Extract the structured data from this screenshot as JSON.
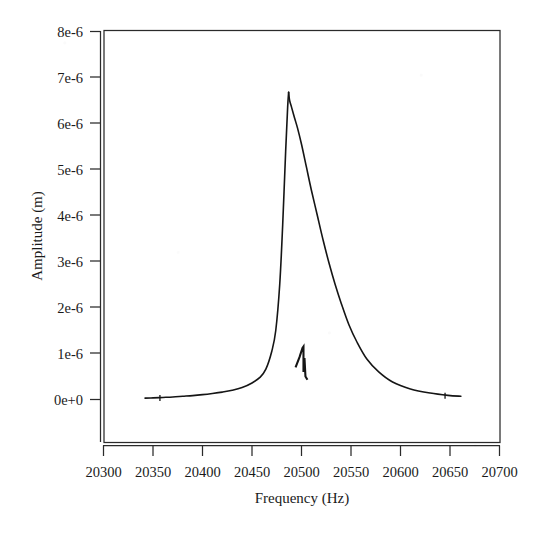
{
  "chart_data": {
    "type": "line",
    "title": "",
    "xlabel": "Frequency (Hz)",
    "ylabel": "Amplitude (m)",
    "xlim": [
      20300,
      20700
    ],
    "ylim": [
      0,
      8e-06
    ],
    "xticks": [
      20300,
      20350,
      20400,
      20450,
      20500,
      20550,
      20600,
      20650,
      20700
    ],
    "xtick_labels": [
      "20300",
      "20350",
      "20400",
      "20450",
      "20500",
      "20550",
      "20600",
      "20650",
      "20700"
    ],
    "yticks": [
      0,
      1e-06,
      2e-06,
      3e-06,
      4e-06,
      5e-06,
      6e-06,
      7e-06,
      8e-06
    ],
    "ytick_labels": [
      "0e+0",
      "1e-6",
      "2e-6",
      "3e-6",
      "4e-6",
      "5e-6",
      "6e-6",
      "7e-6",
      "8e-6"
    ],
    "grid": false,
    "legend": null,
    "series": [
      {
        "name": "amplitude",
        "x": [
          20342,
          20350,
          20360,
          20370,
          20380,
          20390,
          20400,
          20410,
          20420,
          20430,
          20440,
          20450,
          20458,
          20464,
          20470,
          20474,
          20478,
          20481,
          20484,
          20486,
          20487
        ],
        "y": [
          3e-08,
          3.5e-08,
          4.5e-08,
          5.5e-08,
          7e-08,
          8.5e-08,
          1.05e-07,
          1.3e-07,
          1.6e-07,
          2e-07,
          2.6e-07,
          3.6e-07,
          4.8e-07,
          6.6e-07,
          1.05e-06,
          1.5e-06,
          2.5e-06,
          3.8e-06,
          5.4e-06,
          6.35e-06,
          6.68e-06
        ]
      },
      {
        "name": "amplitude-descent",
        "x": [
          20487,
          20488,
          20490,
          20493,
          20496,
          20500,
          20505,
          20510,
          20516,
          20522,
          20528,
          20534,
          20540,
          20548,
          20556,
          20566,
          20578,
          20592,
          20610,
          20630,
          20648,
          20661
        ],
        "y": [
          6.68e-06,
          6.5e-06,
          6.35e-06,
          6.12e-06,
          5.9e-06,
          5.55e-06,
          5.05e-06,
          4.55e-06,
          4e-06,
          3.45e-06,
          2.95e-06,
          2.5e-06,
          2.1e-06,
          1.62e-06,
          1.25e-06,
          8.8e-07,
          6e-07,
          3.8e-07,
          2.3e-07,
          1.4e-07,
          9e-08,
          7e-08
        ]
      },
      {
        "name": "anti-resonance-spike",
        "x": [
          20494,
          20498,
          20501,
          20502,
          20502,
          20503,
          20504,
          20506
        ],
        "y": [
          7e-07,
          9.2e-07,
          1.12e-06,
          1.15e-06,
          6e-07,
          9e-07,
          5e-07,
          4.3e-07
        ]
      }
    ],
    "annotations": [
      {
        "name": "resonance-peak",
        "x": 20487,
        "y": 6.68e-06
      },
      {
        "name": "anti-resonance",
        "x": 20502,
        "y": 1.15e-06
      }
    ],
    "marks": [
      {
        "name": "tick-mark-right-tail",
        "x": 20645,
        "y": 8e-08
      },
      {
        "name": "tick-mark-left-tail",
        "x": 20357,
        "y": 3.2e-08
      }
    ]
  },
  "style": {
    "line_color": "#151515",
    "axis_color": "#2a2a2a",
    "background": "#ffffff"
  }
}
